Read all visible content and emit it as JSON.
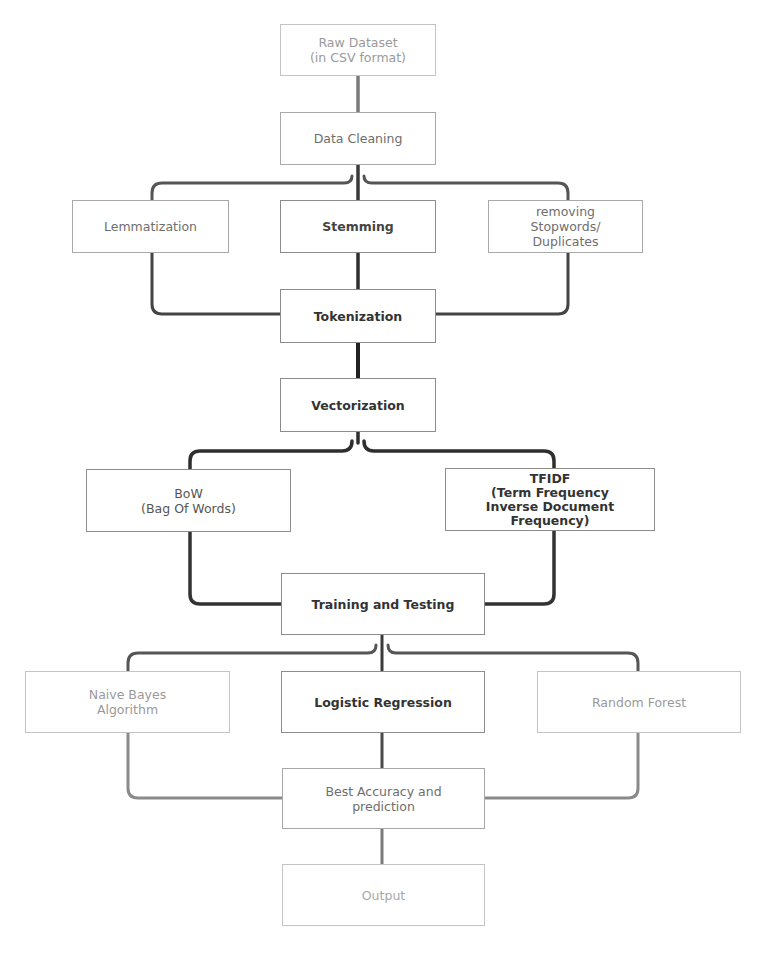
{
  "diagram": {
    "type": "flowchart",
    "direction": "top-to-bottom",
    "colors": {
      "line_dark": "#3a3a3a",
      "line_light": "#8a8a8a",
      "box_border": "#9a9a9a",
      "background": "#ffffff"
    },
    "nodes": {
      "raw_dataset": {
        "label": "Raw Dataset\n(in CSV format)"
      },
      "data_cleaning": {
        "label": "Data Cleaning"
      },
      "lemmatization": {
        "label": "Lemmatization"
      },
      "stemming": {
        "label": "Stemming"
      },
      "removing_stopwords": {
        "label": "removing\nStopwords/\nDuplicates"
      },
      "tokenization": {
        "label": "Tokenization"
      },
      "vectorization": {
        "label": "Vectorization"
      },
      "bow": {
        "label": "BoW\n(Bag Of Words)"
      },
      "tfidf": {
        "label": "TFIDF\n(Term Frequency\nInverse Document\nFrequency)"
      },
      "training_testing": {
        "label": "Training and Testing"
      },
      "naive_bayes": {
        "label": "Naive Bayes\nAlgorithm"
      },
      "logistic_regression": {
        "label": "Logistic Regression"
      },
      "random_forest": {
        "label": "Random Forest"
      },
      "best_accuracy": {
        "label": "Best Accuracy and\nprediction"
      },
      "output": {
        "label": "Output"
      }
    },
    "edges": [
      [
        "raw_dataset",
        "data_cleaning"
      ],
      [
        "data_cleaning",
        "lemmatization"
      ],
      [
        "data_cleaning",
        "stemming"
      ],
      [
        "data_cleaning",
        "removing_stopwords"
      ],
      [
        "lemmatization",
        "tokenization"
      ],
      [
        "stemming",
        "tokenization"
      ],
      [
        "removing_stopwords",
        "tokenization"
      ],
      [
        "tokenization",
        "vectorization"
      ],
      [
        "vectorization",
        "bow"
      ],
      [
        "vectorization",
        "tfidf"
      ],
      [
        "bow",
        "training_testing"
      ],
      [
        "tfidf",
        "training_testing"
      ],
      [
        "training_testing",
        "naive_bayes"
      ],
      [
        "training_testing",
        "logistic_regression"
      ],
      [
        "training_testing",
        "random_forest"
      ],
      [
        "naive_bayes",
        "best_accuracy"
      ],
      [
        "logistic_regression",
        "best_accuracy"
      ],
      [
        "random_forest",
        "best_accuracy"
      ],
      [
        "best_accuracy",
        "output"
      ]
    ]
  }
}
